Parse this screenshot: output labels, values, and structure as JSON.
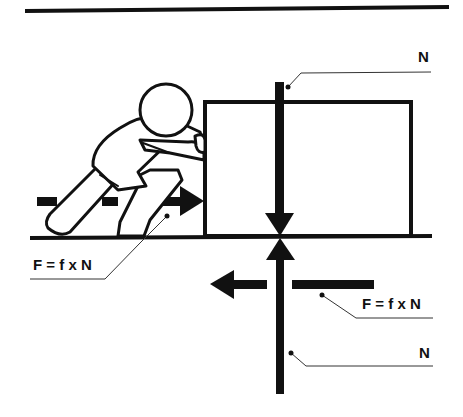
{
  "diagram": {
    "type": "friction-force-illustration",
    "labels": {
      "normal_top": "N",
      "friction_left": "F = f x N",
      "friction_right": "F = f x N",
      "normal_bottom": "N"
    },
    "elements": {
      "person": "person pushing box",
      "box": "box",
      "ground": "ground line",
      "push_arrow": "applied force arrow (right)",
      "friction_arrow": "friction force arrow (left)",
      "weight_arrow": "normal force arrow (down)",
      "reaction_arrow": "normal reaction arrow (up)"
    },
    "colors": {
      "stroke": "#111111",
      "background": "#ffffff"
    }
  }
}
